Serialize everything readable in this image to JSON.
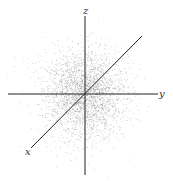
{
  "diagram": {
    "type": "3d-axes-point-cloud",
    "width": 173,
    "height": 181,
    "background": "#ffffff",
    "axis_color": "#222222",
    "point_color": "#555555",
    "origin": {
      "x": 85,
      "y": 94
    },
    "axes": [
      {
        "name": "z",
        "label": "z",
        "from": {
          "x": 85,
          "y": 16
        },
        "to": {
          "x": 85,
          "y": 175
        },
        "label_pos": {
          "x": 83,
          "y": 14
        }
      },
      {
        "name": "y",
        "label": "y",
        "from": {
          "x": 8,
          "y": 94
        },
        "to": {
          "x": 158,
          "y": 94
        },
        "label_pos": {
          "x": 159,
          "y": 97
        }
      },
      {
        "name": "x",
        "label": "x",
        "from": {
          "x": 31,
          "y": 148
        },
        "to": {
          "x": 142,
          "y": 36
        },
        "label_pos": {
          "x": 25,
          "y": 155
        }
      }
    ],
    "point_cloud": {
      "distribution": "gaussian",
      "count": 2600,
      "sigma_x": 20,
      "sigma_y": 22,
      "opacity": 0.35,
      "point_size": 0.8
    }
  }
}
